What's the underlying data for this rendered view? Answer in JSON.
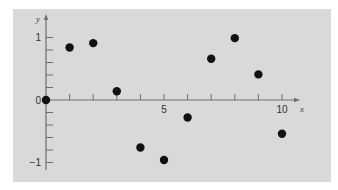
{
  "chart_data": {
    "type": "scatter",
    "title": "",
    "xlabel": "x",
    "ylabel": "y",
    "xlim": [
      0,
      10.6
    ],
    "ylim": [
      -1,
      1.1
    ],
    "grid": false,
    "legend": null,
    "x_tick_labels": [
      {
        "value": 5,
        "label": "5"
      },
      {
        "value": 10,
        "label": "10"
      }
    ],
    "y_tick_labels": [
      {
        "value": 1,
        "label": "1"
      },
      {
        "value": 0,
        "label": "0"
      },
      {
        "value": -1,
        "label": "−1"
      }
    ],
    "x_ticks": [
      1,
      2,
      3,
      4,
      5,
      6,
      7,
      8,
      9,
      10
    ],
    "y_ticks": [
      -1,
      -0.8,
      -0.6,
      -0.4,
      -0.2,
      0.2,
      0.4,
      0.6,
      0.8,
      1
    ],
    "series": [
      {
        "name": "samples",
        "color": "#111111",
        "x": [
          0,
          1,
          2,
          3,
          4,
          5,
          6,
          7,
          8,
          9,
          10
        ],
        "y": [
          0,
          0.84,
          0.91,
          0.14,
          -0.76,
          -0.96,
          -0.28,
          0.66,
          0.99,
          0.41,
          -0.54
        ]
      }
    ]
  },
  "layout": {
    "panel": {
      "x": 13,
      "y": 9,
      "w": 318,
      "h": 173
    },
    "origin_px": {
      "x": 46,
      "y": 100
    },
    "x_px_per_unit": 23.6,
    "y_px_per_unit": 62.5,
    "x_axis_end": 300,
    "y_axis_top": 14,
    "y_axis_bottom": 170
  }
}
